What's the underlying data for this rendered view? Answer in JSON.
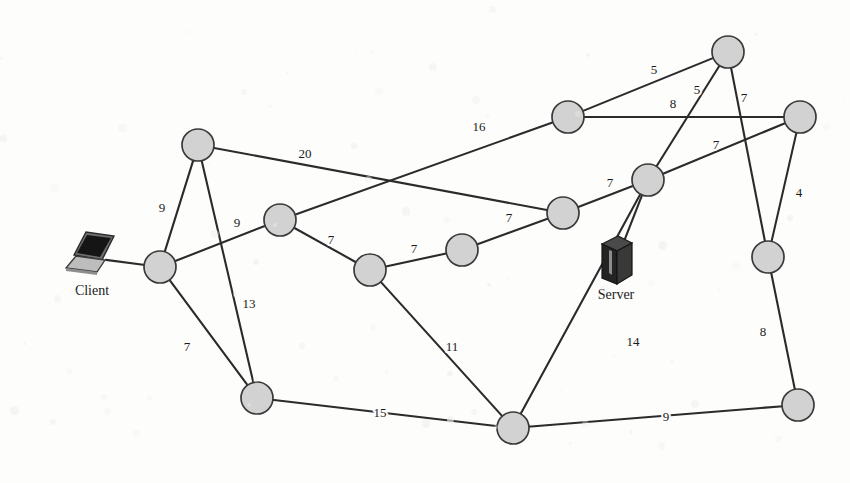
{
  "diagram": {
    "background_color": "#fdfdfc",
    "node_fill": "#d2d2d2",
    "node_stroke": "#3a3a3a",
    "edge_color": "#2b2b2b",
    "node_radius": 16
  },
  "devices": [
    {
      "id": "client",
      "label": "Client",
      "icon": "laptop-icon",
      "x": 92,
      "y": 258,
      "label_x": 92,
      "label_y": 295
    },
    {
      "id": "server",
      "label": "Server",
      "icon": "server-tower-icon",
      "x": 616,
      "y": 262,
      "label_x": 616,
      "label_y": 299
    }
  ],
  "nodes": [
    {
      "id": "n1",
      "x": 198,
      "y": 145
    },
    {
      "id": "n2",
      "x": 160,
      "y": 267
    },
    {
      "id": "n3",
      "x": 280,
      "y": 220
    },
    {
      "id": "n4",
      "x": 257,
      "y": 398
    },
    {
      "id": "n5",
      "x": 370,
      "y": 270
    },
    {
      "id": "n6",
      "x": 462,
      "y": 250
    },
    {
      "id": "n7",
      "x": 563,
      "y": 213
    },
    {
      "id": "n8",
      "x": 568,
      "y": 117
    },
    {
      "id": "n9",
      "x": 728,
      "y": 52
    },
    {
      "id": "n10",
      "x": 800,
      "y": 117
    },
    {
      "id": "n11",
      "x": 648,
      "y": 180
    },
    {
      "id": "n12",
      "x": 768,
      "y": 257
    },
    {
      "id": "n13",
      "x": 513,
      "y": 428
    },
    {
      "id": "n14",
      "x": 798,
      "y": 405
    }
  ],
  "edges": [
    {
      "from": "n1",
      "to": "n2",
      "weight": "9",
      "label_x": 162,
      "label_y": 209
    },
    {
      "from": "n1",
      "to": "n4",
      "weight": "13",
      "label_x": 249,
      "label_y": 305
    },
    {
      "from": "n1",
      "to": "n7",
      "weight": "20",
      "label_x": 305,
      "label_y": 155
    },
    {
      "from": "n2",
      "to": "n3",
      "weight": "9",
      "label_x": 237,
      "label_y": 224
    },
    {
      "from": "n2",
      "to": "n4",
      "weight": "7",
      "label_x": 187,
      "label_y": 348
    },
    {
      "from": "n3",
      "to": "n5",
      "weight": "7",
      "label_x": 331,
      "label_y": 241
    },
    {
      "from": "n3",
      "to": "n8",
      "weight": "16",
      "label_x": 479,
      "label_y": 128
    },
    {
      "from": "n5",
      "to": "n6",
      "weight": "7",
      "label_x": 414,
      "label_y": 250
    },
    {
      "from": "n5",
      "to": "n13",
      "weight": "11",
      "label_x": 452,
      "label_y": 348
    },
    {
      "from": "n6",
      "to": "n7",
      "weight": "7",
      "label_x": 509,
      "label_y": 219
    },
    {
      "from": "n7",
      "to": "n11",
      "weight": "7",
      "label_x": 610,
      "label_y": 184
    },
    {
      "from": "n8",
      "to": "n9",
      "weight": "5",
      "label_x": 654,
      "label_y": 71
    },
    {
      "from": "n8",
      "to": "n10",
      "weight": "8",
      "label_x": 673,
      "label_y": 105
    },
    {
      "from": "n9",
      "to": "n11",
      "weight": "5",
      "label_x": 697,
      "label_y": 91
    },
    {
      "from": "n9",
      "to": "n12",
      "weight": "7",
      "label_x": 744,
      "label_y": 99
    },
    {
      "from": "n10",
      "to": "n11",
      "weight": "7",
      "label_x": 716,
      "label_y": 146
    },
    {
      "from": "n10",
      "to": "n12",
      "weight": "4",
      "label_x": 799,
      "label_y": 194
    },
    {
      "from": "n11",
      "to": "n13",
      "weight": "14",
      "label_x": 633,
      "label_y": 343
    },
    {
      "from": "n12",
      "to": "n14",
      "weight": "8",
      "label_x": 763,
      "label_y": 333
    },
    {
      "from": "n13",
      "to": "n14",
      "weight": "9",
      "label_x": 666,
      "label_y": 418
    },
    {
      "from": "n4",
      "to": "n13",
      "weight": "15",
      "label_x": 380,
      "label_y": 414
    },
    {
      "from": "client",
      "to": "n2",
      "weight": "",
      "label_x": 0,
      "label_y": 0
    },
    {
      "from": "server",
      "to": "n11",
      "weight": "",
      "label_x": 0,
      "label_y": 0
    }
  ]
}
